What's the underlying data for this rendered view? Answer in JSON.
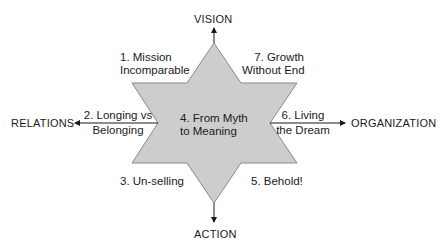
{
  "diagram": {
    "type": "six-pointed star",
    "fill_color": "#cdcdcd",
    "stroke_color": "#8a8a8a",
    "axes": {
      "top": "VISION",
      "bottom": "ACTION",
      "left": "RELATIONS",
      "right": "ORGANIZATION"
    },
    "center": {
      "line1": "4. From Myth",
      "line2": "to Meaning"
    },
    "points": [
      {
        "id": 1,
        "line1": "1. Mission",
        "line2": "Incomparable"
      },
      {
        "id": 2,
        "line1": "2. Longing vs",
        "line2": "Belonging"
      },
      {
        "id": 3,
        "line1": "3. Un-selling"
      },
      {
        "id": 5,
        "line1": "5. Behold!"
      },
      {
        "id": 6,
        "line1": "6. Living",
        "line2": "the Dream"
      },
      {
        "id": 7,
        "line1": "7. Growth",
        "line2": "Without End"
      }
    ]
  }
}
